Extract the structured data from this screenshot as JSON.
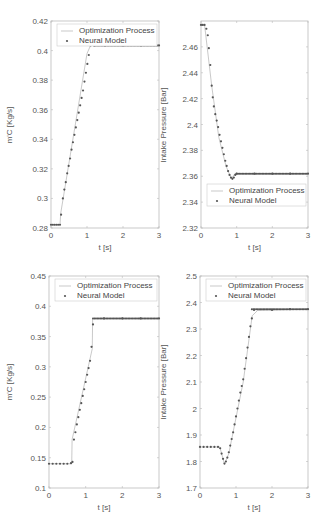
{
  "chart_data": [
    {
      "type": "scatter",
      "panel": "top-left",
      "title": "",
      "xlabel": "t [s]",
      "ylabel": "m'_C [Kg/s]",
      "xlim": [
        0,
        3
      ],
      "ylim": [
        0.28,
        0.42
      ],
      "xticks": [
        "0",
        "1",
        "2",
        "3"
      ],
      "yticks": [
        "0.28",
        "0.3",
        "0.32",
        "0.34",
        "0.36",
        "0.38",
        "0.4",
        "0.42"
      ],
      "legend": [
        "Optimization Process",
        "Neural Model"
      ],
      "legend_position": "upper",
      "series": [
        {
          "name": "Optimization Process",
          "x": [
            0,
            0.25,
            0.27,
            1.0,
            1.1,
            3.0
          ],
          "y": [
            0.2822,
            0.2822,
            0.29,
            0.398,
            0.4035,
            0.4035
          ]
        },
        {
          "name": "Neural Model",
          "x": [
            0,
            0.05,
            0.1,
            0.15,
            0.2,
            0.25,
            0.28,
            0.33,
            0.37,
            0.41,
            0.45,
            0.49,
            0.53,
            0.57,
            0.61,
            0.65,
            0.69,
            0.73,
            0.77,
            0.81,
            0.85,
            0.89,
            0.93,
            0.97,
            1.01,
            1.05,
            1.1,
            1.2,
            1.5,
            2.0,
            2.5,
            3.0
          ],
          "y": [
            0.2822,
            0.2822,
            0.2822,
            0.2822,
            0.2822,
            0.2822,
            0.289,
            0.3,
            0.306,
            0.311,
            0.317,
            0.322,
            0.327,
            0.333,
            0.338,
            0.343,
            0.348,
            0.353,
            0.358,
            0.363,
            0.368,
            0.373,
            0.379,
            0.385,
            0.391,
            0.397,
            0.4035,
            0.4035,
            0.4035,
            0.4035,
            0.4035,
            0.4035
          ]
        }
      ]
    },
    {
      "type": "scatter",
      "panel": "top-right",
      "title": "",
      "xlabel": "t [s]",
      "ylabel": "Intake Pressure [Bar]",
      "xlim": [
        0,
        3
      ],
      "ylim": [
        2.32,
        2.48
      ],
      "xticks": [
        "0",
        "1",
        "2",
        "3"
      ],
      "yticks": [
        "2.32",
        "2.34",
        "2.36",
        "2.38",
        "2.4",
        "2.42",
        "2.44",
        "2.46"
      ],
      "legend": [
        "Optimization Process",
        "Neural Model"
      ],
      "legend_position": "lower",
      "series": [
        {
          "name": "Optimization Process",
          "x": [
            0,
            0.1,
            0.3,
            0.5,
            0.7,
            0.85,
            0.95,
            3.0
          ],
          "y": [
            2.477,
            2.477,
            2.43,
            2.39,
            2.368,
            2.358,
            2.362,
            2.362
          ]
        },
        {
          "name": "Neural Model",
          "x": [
            0,
            0.05,
            0.1,
            0.15,
            0.19,
            0.22,
            0.26,
            0.3,
            0.33,
            0.36,
            0.4,
            0.44,
            0.48,
            0.52,
            0.56,
            0.6,
            0.64,
            0.68,
            0.72,
            0.76,
            0.8,
            0.84,
            0.88,
            0.92,
            0.96,
            1.0,
            1.5,
            2.0,
            2.5,
            3.0
          ],
          "y": [
            2.477,
            2.477,
            2.477,
            2.474,
            2.469,
            2.459,
            2.446,
            2.43,
            2.421,
            2.414,
            2.408,
            2.403,
            2.398,
            2.392,
            2.387,
            2.382,
            2.377,
            2.372,
            2.368,
            2.364,
            2.361,
            2.359,
            2.358,
            2.359,
            2.361,
            2.362,
            2.362,
            2.362,
            2.362,
            2.362
          ]
        }
      ]
    },
    {
      "type": "scatter",
      "panel": "bottom-left",
      "title": "",
      "xlabel": "t [s]",
      "ylabel": "m'_C [Kg/s]",
      "xlim": [
        0,
        3
      ],
      "ylim": [
        0.1,
        0.45
      ],
      "xticks": [
        "0",
        "1",
        "2",
        "3"
      ],
      "yticks": [
        "0.1",
        "0.15",
        "0.2",
        "0.25",
        "0.3",
        "0.35",
        "0.4",
        "0.45"
      ],
      "legend": [
        "Optimization Process",
        "Neural Model"
      ],
      "legend_position": "upper",
      "series": [
        {
          "name": "Optimization Process",
          "x": [
            0,
            0.62,
            0.63,
            1.18,
            1.19,
            3.0
          ],
          "y": [
            0.14,
            0.14,
            0.18,
            0.33,
            0.38,
            0.38
          ]
        },
        {
          "name": "Neural Model",
          "x": [
            0,
            0.1,
            0.2,
            0.3,
            0.4,
            0.5,
            0.6,
            0.64,
            0.68,
            0.72,
            0.76,
            0.8,
            0.84,
            0.88,
            0.92,
            0.96,
            1.0,
            1.04,
            1.08,
            1.12,
            1.16,
            1.2,
            1.5,
            2.0,
            2.5,
            3.0
          ],
          "y": [
            0.14,
            0.14,
            0.14,
            0.14,
            0.14,
            0.14,
            0.141,
            0.143,
            0.18,
            0.192,
            0.205,
            0.217,
            0.229,
            0.24,
            0.252,
            0.263,
            0.275,
            0.287,
            0.298,
            0.31,
            0.333,
            0.37,
            0.38,
            0.38,
            0.38,
            0.38
          ]
        }
      ]
    },
    {
      "type": "scatter",
      "panel": "bottom-right",
      "title": "",
      "xlabel": "t [s]",
      "ylabel": "Intake Pressure [Bar]",
      "xlim": [
        0,
        3
      ],
      "ylim": [
        1.7,
        2.5
      ],
      "xticks": [
        "0",
        "1",
        "2",
        "3"
      ],
      "yticks": [
        "1.7",
        "1.8",
        "1.9",
        "2",
        "2.1",
        "2.2",
        "2.3",
        "2.4",
        "2.5"
      ],
      "legend": [
        "Optimization Process",
        "Neural Model"
      ],
      "legend_position": "upper",
      "series": [
        {
          "name": "Optimization Process",
          "x": [
            0,
            0.55,
            0.68,
            0.8,
            1.2,
            1.45,
            1.6,
            3.0
          ],
          "y": [
            1.855,
            1.855,
            1.79,
            1.83,
            2.1,
            2.35,
            2.37,
            2.375
          ]
        },
        {
          "name": "Neural Model",
          "x": [
            0,
            0.1,
            0.2,
            0.3,
            0.4,
            0.5,
            0.56,
            0.6,
            0.64,
            0.68,
            0.72,
            0.76,
            0.8,
            0.84,
            0.88,
            0.92,
            0.96,
            1.0,
            1.04,
            1.08,
            1.12,
            1.16,
            1.2,
            1.24,
            1.28,
            1.32,
            1.36,
            1.4,
            1.44,
            1.5,
            2.0,
            2.5,
            3.0
          ],
          "y": [
            1.855,
            1.855,
            1.855,
            1.855,
            1.855,
            1.855,
            1.85,
            1.83,
            1.81,
            1.792,
            1.8,
            1.815,
            1.835,
            1.86,
            1.885,
            1.91,
            1.94,
            1.97,
            2.0,
            2.03,
            2.06,
            2.085,
            2.11,
            2.15,
            2.19,
            2.23,
            2.27,
            2.31,
            2.34,
            2.372,
            2.372,
            2.375,
            2.375
          ]
        }
      ]
    }
  ],
  "panels": [
    {
      "xlabel": "t [s]",
      "ylabel": "m'C [Kg/s]",
      "legend": [
        "Optimization Process",
        "Neural Model"
      ]
    },
    {
      "xlabel": "t [s]",
      "ylabel": "Intake Pressure [Bar]",
      "legend": [
        "Optimization Process",
        "Neural Model"
      ]
    },
    {
      "xlabel": "t [s]",
      "ylabel": "m'C [Kg/s]",
      "legend": [
        "Optimization Process",
        "Neural Model"
      ]
    },
    {
      "xlabel": "t [s]",
      "ylabel": "Intake Pressure [Bar]",
      "legend": [
        "Optimization Process",
        "Neural Model"
      ]
    }
  ],
  "colors": {
    "line": "#bbbbbb",
    "marker": "#555555",
    "axis": "#bbbbbb",
    "text": "#555555"
  }
}
